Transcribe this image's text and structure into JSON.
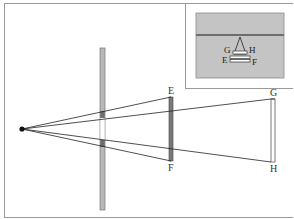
{
  "diagram": {
    "colors": {
      "frame": "#9a9a9a",
      "plate": "#b8b8b8",
      "plate_dark": "#6e6e6e",
      "screen_ef": "#7a7a7a",
      "screen_gh": "#ffffff",
      "ray": "#222222",
      "inset_bg": "#bdbdbd",
      "inset_line": "#6e6e6e"
    },
    "labels": {
      "E": "E",
      "F": "F",
      "G": "G",
      "H": "H"
    },
    "inset": {
      "labels": {
        "G": "G",
        "H": "H",
        "E": "E",
        "F": "F"
      }
    }
  }
}
